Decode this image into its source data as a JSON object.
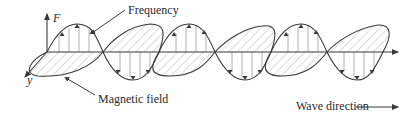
{
  "figure": {
    "labels": {
      "f_axis": "F",
      "y_axis": "y",
      "frequency": "Frequency",
      "magnetic_field": "Magnetic field",
      "wave_direction": "Wave direction"
    },
    "colors": {
      "stroke": "#3a3a3a",
      "hatch": "#9a9a9a",
      "background": "#ffffff"
    }
  }
}
